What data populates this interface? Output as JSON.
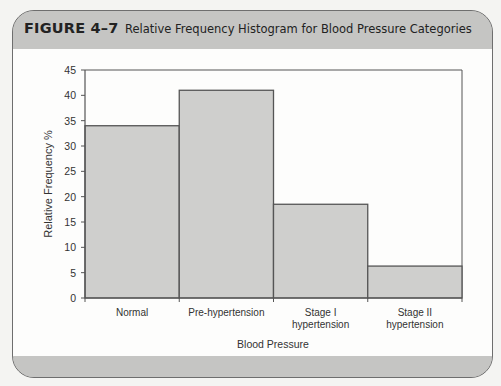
{
  "figure": {
    "label": "FIGURE 4–7",
    "title": "Relative Frequency Histogram for Blood Pressure Categories"
  },
  "colors": {
    "bar_fill": "#cfcfcd",
    "bar_stroke": "#555555",
    "frame_band": "#c5c5c3",
    "axis": "#555555"
  },
  "chart_data": {
    "type": "bar",
    "title": "Relative Frequency Histogram for Blood Pressure Categories",
    "xlabel": "Blood Pressure",
    "ylabel": "Relative Frequency %",
    "categories": [
      "Normal",
      "Pre-hypertension",
      "Stage I hypertension",
      "Stage II hypertension"
    ],
    "category_lines": [
      [
        "Normal"
      ],
      [
        "Pre-hypertension"
      ],
      [
        "Stage I",
        "hypertension"
      ],
      [
        "Stage II",
        "hypertension"
      ]
    ],
    "values": [
      34,
      41,
      18.5,
      6.3
    ],
    "ylim": [
      0,
      45
    ],
    "yticks": [
      0,
      5,
      10,
      15,
      20,
      25,
      30,
      35,
      40,
      45
    ],
    "grid": false,
    "legend": null,
    "bar_gap": 0
  }
}
